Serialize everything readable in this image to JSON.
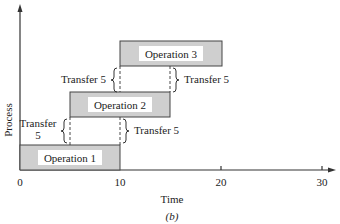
{
  "diagram": {
    "caption": "(b)",
    "y_axis_label": "Process",
    "x_axis_label": "Time",
    "x_ticks": [
      "0",
      "10",
      "20",
      "30"
    ],
    "operations": [
      {
        "label": "Operation 1",
        "start": 0,
        "end": 10
      },
      {
        "label": "Operation 2",
        "start": 5,
        "end": 15
      },
      {
        "label": "Operation 3",
        "start": 10,
        "end": 20
      }
    ],
    "transfers": [
      {
        "label_line1": "Transfer",
        "label_line2": "5",
        "side": "left",
        "between": "Operation 1-Operation 2"
      },
      {
        "label": "Transfer 5",
        "side": "right",
        "between": "Operation 1-Operation 2"
      },
      {
        "label": "Transfer 5",
        "side": "left",
        "between": "Operation 2-Operation 3"
      },
      {
        "label": "Transfer 5",
        "side": "right",
        "between": "Operation 2-Operation 3"
      }
    ],
    "colors": {
      "box_fill": "#cfcfcf",
      "label_bg": "#ffffff",
      "line": "#333333"
    }
  }
}
